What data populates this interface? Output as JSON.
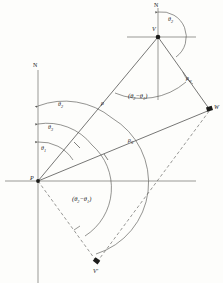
{
  "figure": {
    "type": "geometry-diagram",
    "background_color": "#fdfdfb",
    "line_color": "#4a4a48",
    "arc_color": "#5a5a57",
    "dash_color": "#6b6b68"
  },
  "points": [
    {
      "id": "P",
      "label": "P",
      "x": 38,
      "y": 181,
      "marker": "dot"
    },
    {
      "id": "V",
      "label": "V",
      "x": 158,
      "y": 37,
      "marker": "dot"
    },
    {
      "id": "W",
      "label": "W",
      "x": 210,
      "y": 110,
      "marker": "square"
    },
    {
      "id": "Vp",
      "label": "V'",
      "x": 97,
      "y": 262,
      "marker": "square"
    }
  ],
  "axes": [
    {
      "name": "north-axis-P",
      "label": "N",
      "vertical": true,
      "x": 38,
      "y_top": 70,
      "y_bottom": 283
    },
    {
      "name": "east-axis-P",
      "label": "",
      "vertical": false,
      "y": 181,
      "x_left": 5,
      "x_right": 196
    },
    {
      "name": "north-axis-V",
      "label": "N",
      "vertical": true,
      "x": 158,
      "y_top": 8,
      "y_bottom": 100
    },
    {
      "name": "east-axis-V",
      "label": "",
      "vertical": false,
      "y": 37,
      "x_left": 127,
      "x_right": 196
    }
  ],
  "angles": {
    "theta1": "θ",
    "theta1_sub": "1",
    "theta2": "θ",
    "theta2_sub": "2",
    "theta3": "θ",
    "theta3_sub": "3",
    "theta2_at_V": "θ",
    "theta2_at_V_sub": "2",
    "difference_upper_open": "(θ",
    "difference_upper_sub1": "2",
    "difference_upper_mid": "−θ",
    "difference_upper_sub2": "1",
    "difference_upper_close": ")",
    "difference_lower_open": "(θ",
    "difference_lower_sub1": "2",
    "difference_lower_mid": "−θ",
    "difference_lower_sub2": "1",
    "difference_lower_close": ")"
  },
  "distances": {
    "rho": "ρ",
    "rho_zero": "ρ",
    "rho_zero_sub": "0",
    "rho_w": "ρ",
    "rho_w_sub": "w"
  },
  "lines": [
    {
      "name": "segment-P-V",
      "from": "P",
      "to": "V",
      "style": "solid"
    },
    {
      "name": "segment-V-W",
      "from": "V",
      "to": "W",
      "style": "solid"
    },
    {
      "name": "segment-P-W",
      "from": "P",
      "to": "W",
      "style": "solid"
    },
    {
      "name": "segment-P-Vp",
      "from": "P",
      "to": "Vp",
      "style": "dashed"
    },
    {
      "name": "segment-Vp-W",
      "from": "Vp",
      "to": "W",
      "style": "dashed"
    }
  ]
}
